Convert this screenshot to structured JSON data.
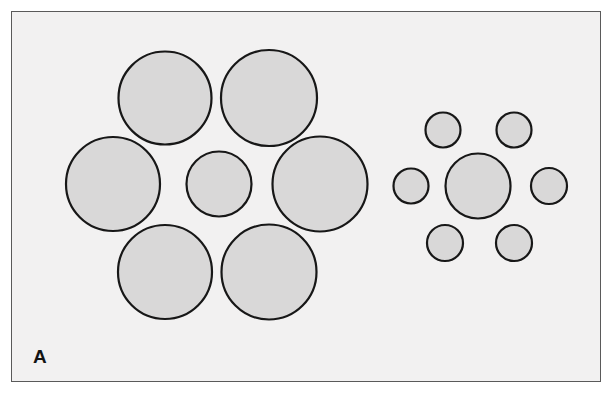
{
  "figure": {
    "panel_label": "A",
    "illusion_name": "Ebbinghaus illusion",
    "background_color": "#ffffff",
    "panel_fill": "#f2f1f1",
    "panel_border_color": "#5a5a5a",
    "circle_fill": "#d9d8d8",
    "circle_stroke": "#171717",
    "label_color": "#141414",
    "panel": {
      "x": 11,
      "y": 11,
      "width": 590,
      "height": 371
    },
    "label_position": {
      "x": 33,
      "y": 347
    }
  },
  "chart_data": {
    "type": "scatter",
    "subtitle": "",
    "xlabel": "",
    "ylabel": "",
    "grid": false,
    "legend_position": "none",
    "xlim": [
      0,
      613
    ],
    "ylim": [
      0,
      396
    ],
    "annotations": [
      "A"
    ],
    "series": [
      {
        "name": "left-cluster-target",
        "role": "central target circle surrounded by large inducers",
        "values": [
          {
            "id": "L-center",
            "cx": 219,
            "cy": 184,
            "r": 32.5,
            "diameter": 65
          }
        ]
      },
      {
        "name": "left-cluster-inducers",
        "role": "six large surrounding circles",
        "values": [
          {
            "id": "L-top-left",
            "cx": 165,
            "cy": 98,
            "r": 46.5,
            "diameter": 93
          },
          {
            "id": "L-top-right",
            "cx": 269,
            "cy": 98,
            "r": 48.0,
            "diameter": 96
          },
          {
            "id": "L-mid-left",
            "cx": 113,
            "cy": 184,
            "r": 47.0,
            "diameter": 94
          },
          {
            "id": "L-mid-right",
            "cx": 320,
            "cy": 184,
            "r": 47.5,
            "diameter": 95
          },
          {
            "id": "L-bottom-left",
            "cx": 165,
            "cy": 272,
            "r": 47.0,
            "diameter": 94
          },
          {
            "id": "L-bottom-right",
            "cx": 269,
            "cy": 272,
            "r": 47.5,
            "diameter": 95
          }
        ]
      },
      {
        "name": "right-cluster-target",
        "role": "central target circle surrounded by small inducers",
        "values": [
          {
            "id": "R-center",
            "cx": 478,
            "cy": 186,
            "r": 32.5,
            "diameter": 65
          }
        ]
      },
      {
        "name": "right-cluster-inducers",
        "role": "six small surrounding circles",
        "values": [
          {
            "id": "R-top-left",
            "cx": 443,
            "cy": 130,
            "r": 17.5,
            "diameter": 35
          },
          {
            "id": "R-top-right",
            "cx": 514,
            "cy": 130,
            "r": 17.5,
            "diameter": 35
          },
          {
            "id": "R-mid-left",
            "cx": 411,
            "cy": 186,
            "r": 17.5,
            "diameter": 35
          },
          {
            "id": "R-mid-right",
            "cx": 549,
            "cy": 186,
            "r": 18.0,
            "diameter": 36
          },
          {
            "id": "R-bottom-left",
            "cx": 445,
            "cy": 243,
            "r": 18.0,
            "diameter": 36
          },
          {
            "id": "R-bottom-right",
            "cx": 514,
            "cy": 243,
            "r": 18.0,
            "diameter": 36
          }
        ]
      }
    ]
  }
}
